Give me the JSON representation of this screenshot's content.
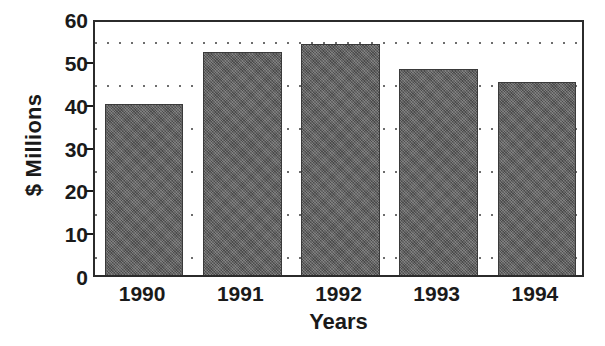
{
  "chart_data": {
    "type": "bar",
    "title": "",
    "xlabel": "Years",
    "ylabel": "$ Millions",
    "categories": [
      "1990",
      "1991",
      "1992",
      "1993",
      "1994"
    ],
    "values": [
      40,
      52,
      54,
      48,
      45
    ],
    "ylim": [
      0,
      60
    ],
    "y_major_ticks": [
      0,
      10,
      20,
      30,
      40,
      50,
      60
    ],
    "y_tick_labels": [
      "0",
      "10",
      "20",
      "30",
      "40",
      "50",
      "60"
    ],
    "y_minor_gridlines": [
      5,
      15,
      25,
      35,
      45,
      55
    ],
    "grid": "dotted-horizontal-minor",
    "legend": "none",
    "bar_color": "#5a5a5a",
    "bar_edge_color": "#3a3a3a",
    "frame_color": "#2b2b2b",
    "background_color": "#ffffff",
    "text_color": "#1a1a1a"
  },
  "axes": {
    "y_title": "$ Millions",
    "x_title": "Years"
  }
}
